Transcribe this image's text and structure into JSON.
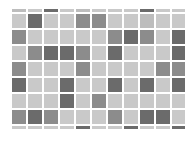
{
  "tile_grid": {
    "columns": 11,
    "rows_full": 7,
    "partial_top_row": true,
    "partial_bottom_row": true,
    "colors": {
      "light": "#c9c9c9",
      "lightmid": "#bdbdbd",
      "mid": "#8c8c8c",
      "dark": "#6b6b6b",
      "gap": "#ffffff"
    },
    "rows": [
      [
        "lightmid",
        "light",
        "dark",
        "light",
        "lightmid",
        "light",
        "light",
        "light",
        "dark",
        "light",
        "light"
      ],
      [
        "light",
        "dark",
        "light",
        "light",
        "mid",
        "mid",
        "light",
        "light",
        "lightmid",
        "light",
        "light"
      ],
      [
        "mid",
        "light",
        "light",
        "light",
        "light",
        "light",
        "mid",
        "dark",
        "mid",
        "light",
        "dark"
      ],
      [
        "light",
        "mid",
        "dark",
        "dark",
        "mid",
        "light",
        "dark",
        "light",
        "light",
        "light",
        "dark"
      ],
      [
        "mid",
        "light",
        "light",
        "light",
        "mid",
        "light",
        "light",
        "light",
        "light",
        "mid",
        "mid"
      ],
      [
        "dark",
        "light",
        "light",
        "dark",
        "light",
        "light",
        "dark",
        "light",
        "dark",
        "light",
        "dark"
      ],
      [
        "light",
        "light",
        "light",
        "dark",
        "light",
        "mid",
        "light",
        "light",
        "light",
        "light",
        "light"
      ],
      [
        "mid",
        "dark",
        "mid",
        "light",
        "light",
        "light",
        "mid",
        "light",
        "dark",
        "dark",
        "light"
      ],
      [
        "light",
        "light",
        "light",
        "light",
        "dark",
        "light",
        "light",
        "dark",
        "light",
        "light",
        "dark"
      ]
    ]
  }
}
